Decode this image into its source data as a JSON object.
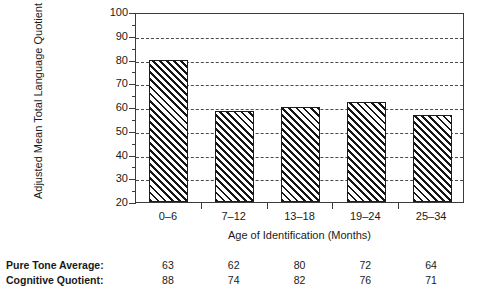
{
  "chart_data": {
    "type": "bar",
    "title": "",
    "xlabel": "Age of Identification (Months)",
    "ylabel": "Adjusted Mean Total Language Quotient",
    "categories": [
      "0–6",
      "7–12",
      "13–18",
      "19–24",
      "25–34"
    ],
    "values": [
      80,
      58.5,
      60,
      62,
      56.5
    ],
    "ylim": [
      20,
      100
    ],
    "yticks": [
      20,
      30,
      40,
      50,
      60,
      70,
      80,
      90,
      100
    ],
    "ytick_labels": [
      "20",
      "30",
      "40",
      "50",
      "60",
      "70",
      "80",
      "90",
      "100"
    ],
    "yminor_step": 5,
    "grid": "horizontal-dashed",
    "legend": "none",
    "bar_fill": "black-diagonal-hatch",
    "bar_edge_color": "#1c1c1c",
    "axis_color": "#3b3b3b",
    "annotations": {
      "rows": [
        {
          "label": "Pure Tone Average:",
          "values": [
            "63",
            "62",
            "80",
            "72",
            "64"
          ]
        },
        {
          "label": "Cognitive Quotient:",
          "values": [
            "88",
            "74",
            "82",
            "76",
            "71"
          ]
        }
      ]
    }
  }
}
